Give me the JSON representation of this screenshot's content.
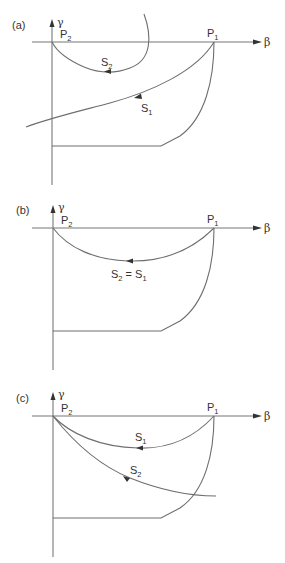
{
  "figure": {
    "colors": {
      "line": "#6e6e6e",
      "text": "#333333",
      "background": "#ffffff"
    },
    "axes": {
      "x_label": "β",
      "y_label": "γ"
    },
    "points": {
      "p1": "P",
      "p1_sub": "1",
      "p2": "P",
      "p2_sub": "2"
    },
    "panels": [
      {
        "id": "a",
        "label": "(a)",
        "curves": [
          {
            "name": "S",
            "sub": "2",
            "description": "loop from above the beta axis curving down and back to P2, arrow pointing toward P2"
          },
          {
            "name": "S",
            "sub": "1",
            "description": "from P1 down-left across the gamma axis, arrow pointing away from P1"
          }
        ]
      },
      {
        "id": "b",
        "label": "(b)",
        "curves": [
          {
            "name": "S",
            "sub": "2",
            "eq": " = ",
            "name2": "S",
            "sub2": "1",
            "description": "single curve from P1 to P2, S2 coincides with S1"
          }
        ]
      },
      {
        "id": "c",
        "label": "(c)",
        "curves": [
          {
            "name": "S",
            "sub": "1",
            "description": "curve from P1 to P2, arrow pointing toward P2"
          },
          {
            "name": "S",
            "sub": "2",
            "description": "curve from P2 down to the right, arrow pointing toward P2"
          }
        ]
      }
    ]
  }
}
